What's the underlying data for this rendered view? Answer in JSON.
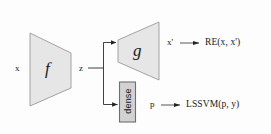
{
  "figure": {
    "background_color": "#fdfdfd",
    "ghost_text_top": "scanned bleed-through text",
    "ghost_text_bottom": "scanned bleed-through text"
  },
  "blocks": {
    "encoder": {
      "label": "f",
      "shape": "trapezoid-narrowing-right",
      "fill": "#e6e6e6",
      "stroke": "#9a9a9a"
    },
    "decoder": {
      "label": "g",
      "shape": "trapezoid-widening-right",
      "fill": "#e6e6e6",
      "stroke": "#9a9a9a"
    },
    "dense": {
      "label": "dense",
      "shape": "rectangle-vertical-text",
      "fill": "#d2d2d2",
      "stroke": "#6f6f6f"
    }
  },
  "signals": {
    "input": "x",
    "latent": "z",
    "reconstruction": "x'",
    "prediction": "p"
  },
  "outputs": {
    "reconstruction_loss": "RE(x, x')",
    "classification_loss": "LSSVM(p, y)"
  },
  "arrows": {
    "arrow_glyph": "arrow-right",
    "count": 4
  }
}
